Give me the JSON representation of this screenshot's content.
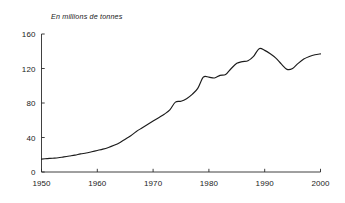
{
  "chart_data": {
    "type": "line",
    "title": "",
    "ylabel": "En millions de tonnes",
    "xlabel": "",
    "xlim": [
      1950,
      2000
    ],
    "ylim": [
      0,
      160
    ],
    "grid": false,
    "legend": null,
    "xticks": [
      "1950",
      "1960",
      "1970",
      "1980",
      "1990",
      "2000"
    ],
    "xtick_values": [
      1950,
      1960,
      1970,
      1980,
      1990,
      2000
    ],
    "yticks": [
      "0",
      "40",
      "80",
      "120",
      "160"
    ],
    "ytick_values": [
      0,
      40,
      80,
      120,
      160
    ],
    "series": [
      {
        "name": "Production",
        "color": "#1c1c1c",
        "x": [
          1950,
          1951,
          1952,
          1953,
          1954,
          1955,
          1956,
          1957,
          1958,
          1959,
          1960,
          1961,
          1962,
          1963,
          1964,
          1965,
          1966,
          1967,
          1968,
          1969,
          1970,
          1971,
          1972,
          1973,
          1974,
          1975,
          1976,
          1977,
          1978,
          1979,
          1980,
          1981,
          1982,
          1983,
          1984,
          1985,
          1986,
          1987,
          1988,
          1989,
          1990,
          1991,
          1992,
          1993,
          1994,
          1995,
          1996,
          1997,
          1998,
          1999,
          2000
        ],
        "values": [
          15,
          15.5,
          16,
          16.5,
          17.5,
          18.5,
          19.5,
          21,
          22,
          23.5,
          25,
          26.5,
          28.5,
          31,
          34,
          38,
          42,
          47,
          51,
          55,
          59,
          63,
          67,
          72,
          81,
          82,
          85,
          90,
          97,
          110,
          110,
          109,
          112,
          113,
          120,
          126,
          128,
          129,
          134,
          143,
          141,
          137,
          132,
          125,
          119,
          120,
          126,
          131,
          134,
          136,
          137
        ]
      }
    ]
  },
  "axes": {
    "ytitle": "En millions de tonnes"
  }
}
